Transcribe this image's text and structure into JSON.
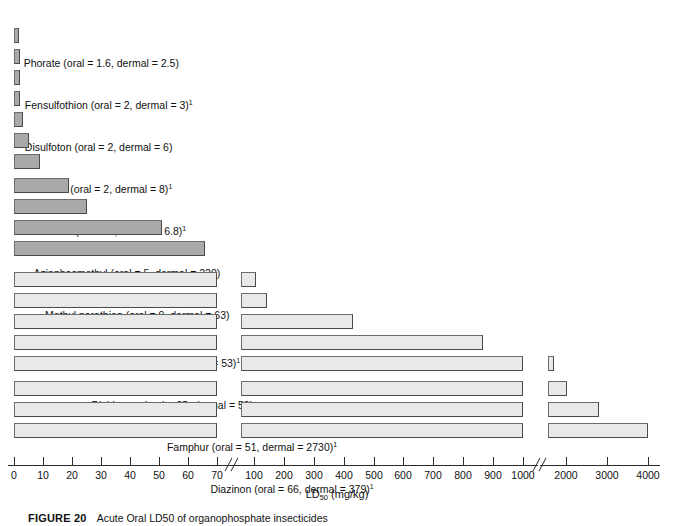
{
  "figure": {
    "number_label": "FIGURE 20",
    "caption_text": "Acute Oral LD50 of organophosphate insecticides"
  },
  "axis": {
    "title_main": "LD",
    "title_sub": "50",
    "title_units": " (mg/kg)",
    "ticks": [
      "0",
      "10",
      "20",
      "30",
      "40",
      "50",
      "60",
      "70",
      "100",
      "200",
      "300",
      "400",
      "500",
      "600",
      "700",
      "800",
      "900",
      "1000",
      "2000",
      "3000",
      "4000"
    ],
    "breaks": 2
  },
  "chart_data": {
    "type": "bar",
    "orientation": "horizontal",
    "title": "Acute Oral LD50 of organophosphate insecticides",
    "xlabel": "LD50 (mg/kg)",
    "ylabel": "",
    "axis_ticks": [
      0,
      10,
      20,
      30,
      40,
      50,
      60,
      70,
      100,
      200,
      300,
      400,
      500,
      600,
      700,
      800,
      900,
      1000,
      2000,
      3000,
      4000
    ],
    "axis_breaks": [
      [
        70,
        100
      ],
      [
        1000,
        2000
      ]
    ],
    "value_key": "oral LD50 (mg/kg)",
    "categories": [
      "Phorate",
      "Fensulfothion",
      "Disulfoton",
      "Demeton",
      "Parathion",
      "Azinphosmethyl",
      "Methyl parathion",
      "Dioxathion",
      "Dichlorvos",
      "Famphur",
      "Diazinon",
      "Solprophos",
      "Trichlorfon",
      "Naled",
      "Acephate",
      "Chlorpyrifosmethyl",
      "Temephos",
      "Malathion",
      "Tetrachlorvinphos"
    ],
    "values": [
      1.6,
      2,
      2,
      2,
      3,
      5,
      9,
      19,
      25,
      51,
      66,
      107,
      144,
      430,
      866,
      1630,
      2030,
      2800,
      4000
    ],
    "dermal": [
      2.5,
      3,
      6,
      8,
      6.8,
      220,
      63,
      53,
      59,
      2730,
      379,
      820,
      ">2000",
      1100,
      ">2000",
      2000,
      970,
      4100,
      null
    ],
    "items": [
      {
        "name": "Phorate",
        "oral": 1.6,
        "dermal": "2.5",
        "label": "Phorate (oral = 1.6, dermal = 2.5)",
        "footnote": false
      },
      {
        "name": "Fensulfothion",
        "oral": 2,
        "dermal": "3",
        "label": "Fensulfothion (oral = 2, dermal = 3)",
        "footnote": true
      },
      {
        "name": "Disulfoton",
        "oral": 2,
        "dermal": "6",
        "label": "Disulfoton (oral = 2, dermal = 6)",
        "footnote": false
      },
      {
        "name": "Demeton",
        "oral": 2,
        "dermal": "8",
        "label": "Demeton (oral = 2, dermal = 8)",
        "footnote": true
      },
      {
        "name": "Parathion",
        "oral": 3,
        "dermal": "6.8",
        "label": "Parathion (oral = 3, dermal = 6.8)",
        "footnote": true
      },
      {
        "name": "Azinphosmethyl",
        "oral": 5,
        "dermal": "220",
        "label": "Azinphosmethyl (oral = 5, dermal = 220)",
        "footnote": false
      },
      {
        "name": "Methyl parathion",
        "oral": 9,
        "dermal": "63",
        "label": "Methyl parathion (oral = 9, dermal = 63)",
        "footnote": false
      },
      {
        "name": "Dioxathion",
        "oral": 19,
        "dermal": "53",
        "label": "Dioxathion (oral = 19, dermal = 53)",
        "footnote": true
      },
      {
        "name": "Dichlorvos",
        "oral": 25,
        "dermal": "59",
        "label": "Dichlorvos (oral = 25, dermal = 59)",
        "footnote": false
      },
      {
        "name": "Famphur",
        "oral": 51,
        "dermal": "2730",
        "label": "Famphur (oral = 51, dermal = 2730)",
        "footnote": true
      },
      {
        "name": "Diazinon",
        "oral": 66,
        "dermal": "379",
        "label": "Diazinon (oral = 66, dermal = 379)",
        "footnote": true
      },
      {
        "name": "Solprophos",
        "oral": 107,
        "dermal": "820",
        "label": "Solprophos (oral = 107, dermal = 820)",
        "footnote": false
      },
      {
        "name": "Trichlorfon",
        "oral": 144,
        "dermal": ">2000",
        "label": "Trichlorfon (oral = 144, dermal >2000)",
        "footnote": false
      },
      {
        "name": "Naled",
        "oral": 430,
        "dermal": "1100",
        "label": "Naled (oral = 430, dermal = 1100)",
        "footnote": false
      },
      {
        "name": "Acephate",
        "oral": 866,
        "dermal": ">2000",
        "label": "Acephate (oral = 866, dermal >2000)",
        "footnote": false
      },
      {
        "name": "Chlorpyrifosmethyl",
        "oral": 1630,
        "dermal": "2000",
        "label": "Chlorpyrifosmethyl (oral = 1630, dermal = 2000)",
        "footnote": false
      },
      {
        "name": "Temephos",
        "oral": 2030,
        "dermal": "970",
        "label": "Temephos (oral = 2030, dermal = 970)",
        "footnote": false
      },
      {
        "name": "Malathion",
        "oral": 2800,
        "dermal": "4100",
        "label": "Malathion (oral = 2800, dermal = 4100)",
        "footnote": false
      },
      {
        "name": "Tetrachlorvinphos",
        "oral": 4000,
        "dermal": null,
        "label": "Tetrachlorvinphos (oral = 4000)",
        "footnote": false
      }
    ],
    "grid": false,
    "legend": "none",
    "colors": {
      "bar_small": "#a9a9a9",
      "bar_large": "#e9e9e9",
      "bar_border": "#6d6d6d",
      "axis": "#2b2b2b",
      "text": "#111111"
    }
  }
}
